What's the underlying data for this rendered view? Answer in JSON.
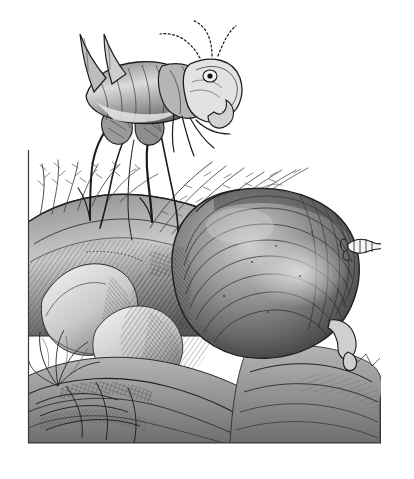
{
  "figure": {
    "kind": "engraving",
    "medium": "black-and-white line engraving / stipple",
    "title": "",
    "caption": "",
    "background_color": "#ffffff",
    "ink_color": "#1a1a1a",
    "mid_tone_color": "#6e6e6e",
    "light_tone_color": "#b9b9b9",
    "frame": {
      "visible_sides": "left and bottom rule line",
      "left_x": 28,
      "bottom_y": 443,
      "right_x": 381,
      "top_y": 150,
      "line_color": "#3a3a3a"
    }
  },
  "scene": {
    "description": "A long-legged insect stands on a grassy rocky mound at upper left; a huge smooth bulbous body rests on the rocks at right.",
    "subjects": [
      {
        "name": "insect",
        "label": "long-legged insect",
        "position": "upper left",
        "parts": [
          "two long curved cerci / tail spines",
          "segmented arched antennae",
          "large rounded head with eye",
          "downward curved mouthparts",
          "segmented thorax and abdomen",
          "four long thread-like legs",
          "two slender palps"
        ]
      },
      {
        "name": "bulb",
        "label": "large bulbous body",
        "position": "right of centre",
        "parts": [
          "smooth domed shell with concentric engraved hatching",
          "small segmented head-like appendage at right",
          "small clawed leg at lower right"
        ]
      }
    ],
    "terrain": [
      {
        "name": "grass-tuft-left",
        "label": "grass tuft"
      },
      {
        "name": "grass-tuft-right",
        "label": "grass spray"
      },
      {
        "name": "rock-ridge",
        "label": "rock ridge"
      },
      {
        "name": "boulder",
        "label": "pale boulder"
      },
      {
        "name": "leaf-cluster",
        "label": "leaf cluster"
      },
      {
        "name": "foreground-rocks",
        "label": "foreground rocks"
      }
    ]
  },
  "annotations": {
    "figure_number": "",
    "scale_bar": "",
    "signature": ""
  }
}
